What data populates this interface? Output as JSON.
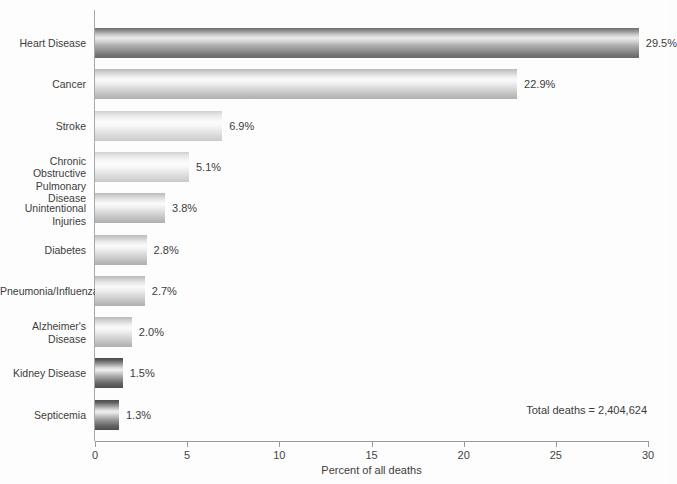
{
  "chart_data": {
    "type": "bar",
    "orientation": "horizontal",
    "title": "",
    "xlabel": "Percent of all deaths",
    "ylabel": "",
    "xlim": [
      0,
      30
    ],
    "xticks": [
      0,
      5,
      10,
      15,
      20,
      25,
      30
    ],
    "xtick_labels": [
      "0",
      "5",
      "10",
      "15",
      "20",
      "25",
      "30"
    ],
    "grid": false,
    "legend": null,
    "categories": [
      "Heart Disease",
      "Cancer",
      "Stroke",
      "Chronic Obstructive\nPulmonary Disease",
      "Unintentional Injuries",
      "Diabetes",
      "Pneumonia/Influenza",
      "Alzheimer's\nDisease",
      "Kidney Disease",
      "Septicemia"
    ],
    "values": [
      29.5,
      22.9,
      6.9,
      5.1,
      3.8,
      2.8,
      2.7,
      2.0,
      1.5,
      1.3
    ],
    "value_labels": [
      "29.5%",
      "22.9%",
      "6.9%",
      "5.1%",
      "3.8%",
      "2.8%",
      "2.7%",
      "2.0%",
      "1.5%",
      "1.3%"
    ],
    "bar_shades": [
      "dark",
      "mid",
      "light",
      "light",
      "mid",
      "mid",
      "mid",
      "mid",
      "darkest",
      "darkest"
    ],
    "annotations": [
      {
        "name": "total-deaths",
        "text": "Total deaths = 2,404,624"
      }
    ]
  },
  "colors": {
    "background": "#fdfdfd",
    "axis": "#9a9a9a",
    "text": "#3c3c3c",
    "bar_dark": "#6f6f6f",
    "bar_light": "#ededed"
  },
  "axis": {
    "x_title": "Percent of all deaths"
  },
  "note": {
    "total_deaths": "Total deaths = 2,404,624"
  }
}
